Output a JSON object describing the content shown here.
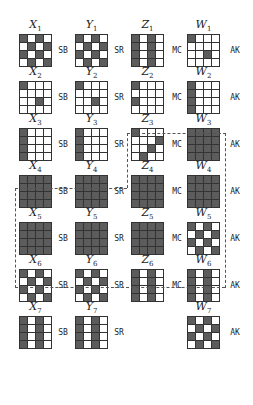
{
  "diagram": {
    "colors": {
      "dark_cell": "#5c5c5c",
      "light_cell": "#ffffff",
      "grid_line": "#333333",
      "dashed_border": "#555555"
    },
    "columns": [
      {
        "var": "X",
        "op": "SB"
      },
      {
        "var": "Y",
        "op": "SR"
      },
      {
        "var": "Z",
        "op": "MC"
      },
      {
        "var": "W",
        "op": "AK"
      }
    ],
    "rows": [
      {
        "round": 1,
        "labels": [
          "X",
          "Y",
          "Z",
          "W"
        ],
        "subs": [
          "1",
          "1",
          "1",
          "1"
        ],
        "ops": [
          "SB",
          "SR",
          "MC",
          "AK"
        ],
        "grids": [
          [
            "1010",
            "0101",
            "1010",
            "0101"
          ],
          [
            "1010",
            "0101",
            "1010",
            "0101"
          ],
          [
            "1010",
            "1010",
            "1010",
            "1010"
          ],
          [
            "1000",
            "0000",
            "0010",
            "0000"
          ]
        ]
      },
      {
        "round": 2,
        "labels": [
          "X",
          "Y",
          "Z",
          "W"
        ],
        "subs": [
          "2",
          "2",
          "2",
          "2"
        ],
        "ops": [
          "SB",
          "SR",
          "MC",
          "AK"
        ],
        "grids": [
          [
            "1000",
            "0000",
            "0010",
            "0000"
          ],
          [
            "1000",
            "0000",
            "0010",
            "0000"
          ],
          [
            "1000",
            "0000",
            "1000",
            "0000"
          ],
          [
            "1000",
            "1000",
            "1000",
            "1000"
          ]
        ]
      },
      {
        "round": 3,
        "labels": [
          "X",
          "Y",
          "Z",
          "W"
        ],
        "subs": [
          "3",
          "3",
          "3",
          "3"
        ],
        "ops": [
          "SB",
          "SR",
          "MC",
          "AK"
        ],
        "grids": [
          [
            "1000",
            "1000",
            "1000",
            "1000"
          ],
          [
            "1000",
            "1000",
            "1000",
            "1000"
          ],
          [
            "1000",
            "0001",
            "0010",
            "0100"
          ],
          [
            "1111",
            "1111",
            "1111",
            "1111"
          ]
        ]
      },
      {
        "round": 4,
        "labels": [
          "X",
          "Y",
          "Z",
          "W"
        ],
        "subs": [
          "4",
          "4",
          "4",
          "4"
        ],
        "ops": [
          "SB",
          "SR",
          "MC",
          "AK"
        ],
        "grids": [
          [
            "1111",
            "1111",
            "1111",
            "1111"
          ],
          [
            "1111",
            "1111",
            "1111",
            "1111"
          ],
          [
            "1111",
            "1111",
            "1111",
            "1111"
          ],
          [
            "1111",
            "1111",
            "1111",
            "1111"
          ]
        ]
      },
      {
        "round": 5,
        "labels": [
          "X",
          "Y",
          "Z",
          "W"
        ],
        "subs": [
          "5",
          "5",
          "5",
          "5"
        ],
        "ops": [
          "SB",
          "SR",
          "MC",
          "AK"
        ],
        "grids": [
          [
            "1111",
            "1111",
            "1111",
            "1111"
          ],
          [
            "1111",
            "1111",
            "1111",
            "1111"
          ],
          [
            "1111",
            "1111",
            "1111",
            "1111"
          ],
          [
            "1010",
            "0101",
            "1010",
            "0101"
          ]
        ]
      },
      {
        "round": 6,
        "labels": [
          "X",
          "Y",
          "Z",
          "W"
        ],
        "subs": [
          "6",
          "6",
          "6",
          "6"
        ],
        "ops": [
          "SB",
          "SR",
          "MC",
          "AK"
        ],
        "grids": [
          [
            "1010",
            "0101",
            "1010",
            "0101"
          ],
          [
            "1010",
            "0101",
            "1010",
            "0101"
          ],
          [
            "1010",
            "1010",
            "1010",
            "1010"
          ],
          [
            "1010",
            "1010",
            "1010",
            "1010"
          ]
        ]
      },
      {
        "round": 7,
        "labels": [
          "X",
          "Y",
          null,
          "W"
        ],
        "subs": [
          "7",
          "7",
          null,
          "7"
        ],
        "ops": [
          "SB",
          "SR",
          null,
          "AK"
        ],
        "grids": [
          [
            "1010",
            "1010",
            "1010",
            "1010"
          ],
          [
            "1010",
            "1010",
            "1010",
            "1010"
          ],
          null,
          [
            "1010",
            "0101",
            "1010",
            "0101"
          ]
        ]
      }
    ],
    "dashed_region": {
      "description": "encloses Z3, W3 and rows 4–5 (X4..W5)"
    }
  }
}
